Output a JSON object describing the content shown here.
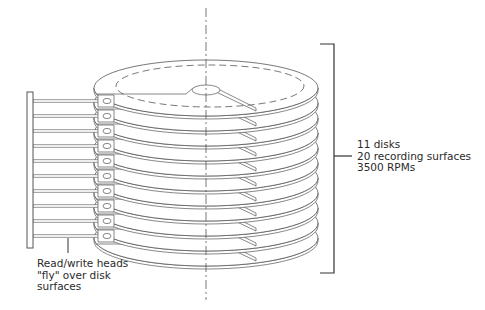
{
  "diagram": {
    "disk_count": 11,
    "spec_lines": [
      "11 disks",
      "20 recording surfaces",
      "3500 RPMs"
    ],
    "heads_lines": [
      "Read/write heads",
      "\"fly\" over disk",
      "surfaces"
    ],
    "colors": {
      "stroke": "#555555",
      "text": "#2a2a2a",
      "background": "#ffffff"
    }
  }
}
